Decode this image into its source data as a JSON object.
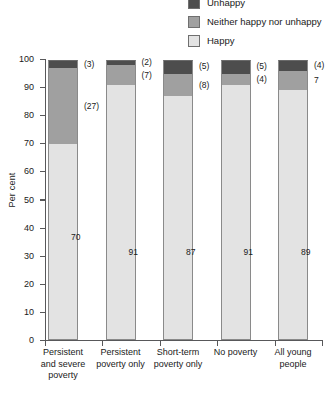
{
  "legend": {
    "items": [
      {
        "label": "Unhappy",
        "color": "#4d4d4d",
        "clipped": true
      },
      {
        "label": "Neither happy nor unhappy",
        "color": "#a0a0a0",
        "clipped": false
      },
      {
        "label": "Happy",
        "color": "#e3e3e3",
        "clipped": false
      }
    ]
  },
  "axes": {
    "ylabel": "Per cent",
    "yticks": [
      "100",
      "90",
      "80",
      "70",
      "60",
      "50",
      "40",
      "30",
      "20",
      "10",
      "0"
    ]
  },
  "categories": [
    {
      "lines": [
        "Persistent",
        "and severe",
        "poverty"
      ]
    },
    {
      "lines": [
        "Persistent",
        "poverty only"
      ]
    },
    {
      "lines": [
        "Short-term",
        "poverty only"
      ]
    },
    {
      "lines": [
        "No poverty"
      ]
    },
    {
      "lines": [
        "All young",
        "people"
      ]
    }
  ],
  "bars": [
    {
      "happy": "70",
      "neither": "(27)",
      "unhappy": "(3)"
    },
    {
      "happy": "91",
      "neither": "(7)",
      "unhappy": "(2)"
    },
    {
      "happy": "87",
      "neither": "(8)",
      "unhappy": "(5)"
    },
    {
      "happy": "91",
      "neither": "(4)",
      "unhappy": "(5)"
    },
    {
      "happy": "89",
      "neither": "7",
      "unhappy": "(4)"
    }
  ],
  "chart_data": {
    "type": "bar",
    "stacked": true,
    "title": "",
    "xlabel": "",
    "ylabel": "Per cent",
    "ylim": [
      0,
      100
    ],
    "yticks": [
      0,
      10,
      20,
      30,
      40,
      50,
      60,
      70,
      80,
      90,
      100
    ],
    "grid": false,
    "legend_position": "top-right",
    "categories": [
      "Persistent and severe poverty",
      "Persistent poverty only",
      "Short-term poverty only",
      "No poverty",
      "All young people"
    ],
    "series": [
      {
        "name": "Happy",
        "color": "#e3e3e3",
        "values": [
          70,
          91,
          87,
          91,
          89
        ],
        "labels": [
          "70",
          "91",
          "87",
          "91",
          "89"
        ]
      },
      {
        "name": "Neither happy nor unhappy",
        "color": "#a0a0a0",
        "values": [
          27,
          7,
          8,
          4,
          7
        ],
        "labels": [
          "(27)",
          "(7)",
          "(8)",
          "(4)",
          "7"
        ]
      },
      {
        "name": "Unhappy",
        "color": "#4d4d4d",
        "values": [
          3,
          2,
          5,
          5,
          4
        ],
        "labels": [
          "(3)",
          "(2)",
          "(5)",
          "(5)",
          "(4)"
        ]
      }
    ]
  }
}
